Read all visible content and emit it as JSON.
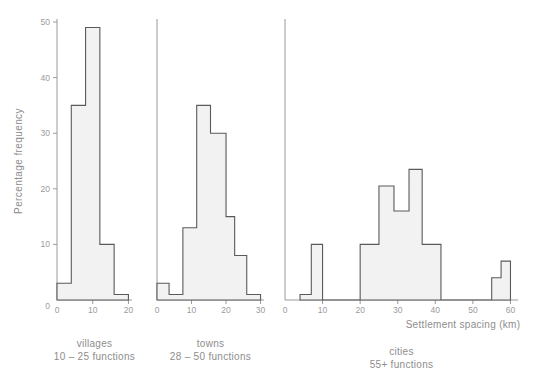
{
  "figure": {
    "background": "#ffffff",
    "fill_color": "#f2f2f2",
    "outline_color": "#5a5a5a",
    "text_color": "#8d8d8d",
    "axis_color": "#9a9a9a",
    "ylabel": "Percentage frequency",
    "xlabel": "Settlement spacing (km)"
  },
  "panels": [
    {
      "key": "villages",
      "caption_line1": "villages",
      "caption_line2": "10 – 25 functions",
      "xticks": [
        0,
        10,
        20
      ],
      "xticklabels": [
        "0",
        "10",
        "20"
      ]
    },
    {
      "key": "towns",
      "caption_line1": "towns",
      "caption_line2": "28 – 50 functions",
      "xticks": [
        0,
        10,
        20,
        30
      ],
      "xticklabels": [
        "0",
        "10",
        "20",
        "30"
      ]
    },
    {
      "key": "cities",
      "caption_line1": "cities",
      "caption_line2": "55+ functions",
      "xticks": [
        0,
        10,
        20,
        30,
        40,
        50,
        60
      ],
      "xticklabels": [
        "0",
        "10",
        "20",
        "30",
        "40",
        "50",
        "60"
      ]
    }
  ],
  "yticks": [
    0,
    10,
    20,
    30,
    40,
    50
  ],
  "yticklabels": [
    "0",
    "10",
    "20",
    "30",
    "40",
    "50"
  ],
  "chart_data": {
    "type": "bar",
    "title": "",
    "xlabel": "Settlement spacing (km)",
    "ylabel": "Percentage frequency",
    "ylim": [
      0,
      50
    ],
    "grid": false,
    "legend": "none",
    "note": "Three side-by-side histograms of settlement spacing sharing one y axis (percentage frequency).",
    "panels": [
      {
        "name": "villages",
        "subtitle": "10 – 25 functions",
        "xlim": [
          0,
          21
        ],
        "xticks": [
          0,
          10,
          20
        ],
        "bin_edges": [
          0,
          4,
          8,
          12,
          16,
          20
        ],
        "values": [
          3,
          35,
          49,
          10,
          1
        ]
      },
      {
        "name": "towns",
        "subtitle": "28 – 50 functions",
        "xlim": [
          0,
          31
        ],
        "xticks": [
          0,
          10,
          20,
          30
        ],
        "bin_edges": [
          0,
          3.5,
          7.5,
          11.5,
          15.5,
          20,
          22.5,
          26,
          30
        ],
        "values": [
          3,
          1,
          13,
          35,
          30,
          15,
          8,
          1
        ]
      },
      {
        "name": "cities",
        "subtitle": "55+ functions",
        "xlim": [
          0,
          62
        ],
        "xticks": [
          0,
          10,
          20,
          30,
          40,
          50,
          60
        ],
        "bin_edges": [
          4,
          7,
          10,
          20,
          25,
          29,
          33,
          36.5,
          41.5,
          55,
          57.5,
          60
        ],
        "values": [
          1,
          10,
          0,
          10,
          20.5,
          16,
          23.5,
          10,
          0,
          4,
          7
        ]
      }
    ]
  }
}
